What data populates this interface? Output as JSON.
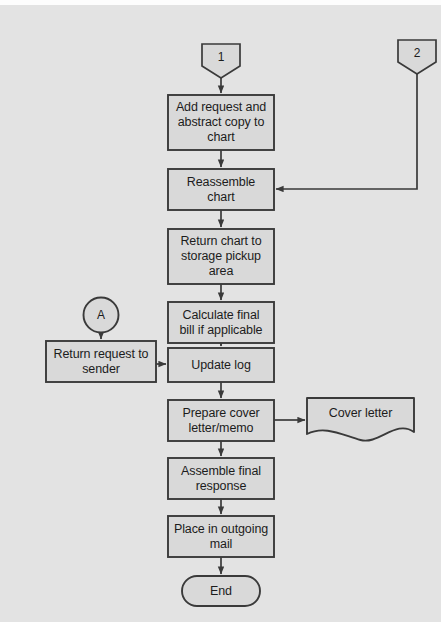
{
  "document": {
    "type": "flowchart",
    "title": "Records request processing flowchart",
    "page_background": "#e3e3e3",
    "shape_fill": "#d9d9d9",
    "stroke_color": "#3a3a3a",
    "text_color": "#1c1c1c"
  },
  "nodes": [
    {
      "id": "conn-1",
      "shape": "offpage-connector",
      "label": "1",
      "x": 202,
      "y": 44,
      "w": 38,
      "h": 34
    },
    {
      "id": "conn-2",
      "shape": "offpage-connector",
      "label": "2",
      "x": 398,
      "y": 40,
      "w": 38,
      "h": 34
    },
    {
      "id": "add-request",
      "shape": "process",
      "label": "Add request and\nabstract copy to\nchart",
      "x": 168,
      "y": 95,
      "w": 106,
      "h": 55
    },
    {
      "id": "reassemble-chart",
      "shape": "process",
      "label": "Reassemble\nchart",
      "x": 168,
      "y": 169,
      "w": 106,
      "h": 41
    },
    {
      "id": "return-chart",
      "shape": "process",
      "label": "Return chart to\nstorage pickup\narea",
      "x": 168,
      "y": 229,
      "w": 106,
      "h": 55
    },
    {
      "id": "calculate-bill",
      "shape": "process",
      "label": "Calculate final\nbill if applicable",
      "x": 168,
      "y": 302,
      "w": 106,
      "h": 41
    },
    {
      "id": "conn-a",
      "shape": "connector-circle",
      "label": "A",
      "x": 83,
      "y": 297,
      "w": 36,
      "h": 36
    },
    {
      "id": "return-request",
      "shape": "process",
      "label": "Return request to\nsender",
      "x": 46,
      "y": 341,
      "w": 110,
      "h": 41
    },
    {
      "id": "update-log",
      "shape": "process",
      "label": "Update log",
      "x": 168,
      "y": 348,
      "w": 106,
      "h": 34
    },
    {
      "id": "prepare-cover",
      "shape": "process",
      "label": "Prepare cover\nletter/memo",
      "x": 168,
      "y": 400,
      "w": 106,
      "h": 41
    },
    {
      "id": "cover-letter",
      "shape": "document",
      "label": "Cover letter",
      "x": 307,
      "y": 398,
      "w": 107,
      "h": 42
    },
    {
      "id": "assemble-response",
      "shape": "process",
      "label": "Assemble final\nresponse",
      "x": 168,
      "y": 458,
      "w": 106,
      "h": 41
    },
    {
      "id": "place-mail",
      "shape": "process",
      "label": "Place in outgoing\nmail",
      "x": 168,
      "y": 516,
      "w": 106,
      "h": 41
    },
    {
      "id": "end-terminator",
      "shape": "terminator",
      "label": "End",
      "x": 182,
      "y": 576,
      "w": 78,
      "h": 30
    }
  ],
  "edges": [
    {
      "id": "e-conn1-add",
      "from": "conn-1",
      "to": "add-request",
      "kind": "vertical"
    },
    {
      "id": "e-add-reassemble",
      "from": "add-request",
      "to": "reassemble-chart",
      "kind": "vertical"
    },
    {
      "id": "e-conn2-reassemble",
      "from": "conn-2",
      "to": "reassemble-chart",
      "kind": "elbow-right"
    },
    {
      "id": "e-reassemble-return",
      "from": "reassemble-chart",
      "to": "return-chart",
      "kind": "vertical"
    },
    {
      "id": "e-return-calculate",
      "from": "return-chart",
      "to": "calculate-bill",
      "kind": "vertical"
    },
    {
      "id": "e-calculate-update",
      "from": "calculate-bill",
      "to": "update-log",
      "kind": "vertical"
    },
    {
      "id": "e-conna-returnreq",
      "from": "conn-a",
      "to": "return-request",
      "kind": "vertical"
    },
    {
      "id": "e-returnreq-update",
      "from": "return-request",
      "to": "update-log",
      "kind": "horizontal"
    },
    {
      "id": "e-update-prepare",
      "from": "update-log",
      "to": "prepare-cover",
      "kind": "vertical"
    },
    {
      "id": "e-prepare-coverdoc",
      "from": "prepare-cover",
      "to": "cover-letter",
      "kind": "horizontal"
    },
    {
      "id": "e-prepare-assemble",
      "from": "prepare-cover",
      "to": "assemble-response",
      "kind": "vertical"
    },
    {
      "id": "e-assemble-place",
      "from": "assemble-response",
      "to": "place-mail",
      "kind": "vertical"
    },
    {
      "id": "e-place-end",
      "from": "place-mail",
      "to": "end-terminator",
      "kind": "vertical"
    }
  ]
}
